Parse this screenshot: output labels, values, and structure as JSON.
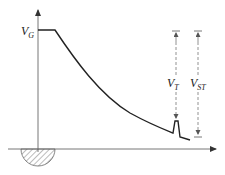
{
  "diagram": {
    "type": "voltage-waveform",
    "labels": {
      "vg": {
        "main": "V",
        "sub": "G"
      },
      "vt": {
        "main": "V",
        "sub": "T"
      },
      "vst": {
        "main": "V",
        "sub": "ST"
      }
    },
    "colors": {
      "axis": "#666666",
      "curve": "#222222",
      "dashed": "#777777",
      "hatch": "#555555"
    }
  }
}
